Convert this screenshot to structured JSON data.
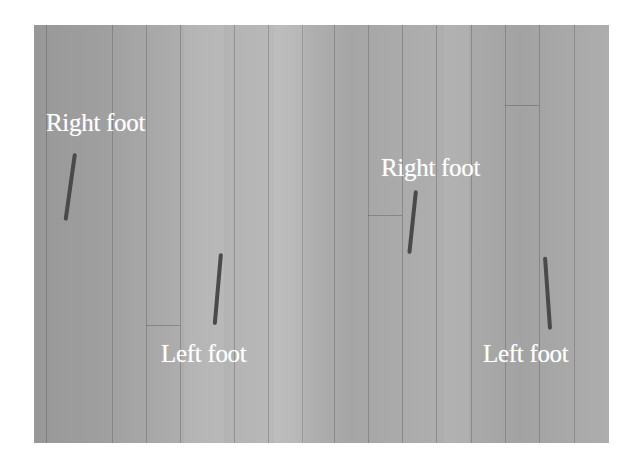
{
  "figure": {
    "labels": [
      {
        "id": "right-foot-1",
        "text": "Right foot",
        "x": 46,
        "y": 110
      },
      {
        "id": "left-foot-1",
        "text": "Left foot",
        "x": 161,
        "y": 341
      },
      {
        "id": "right-foot-2",
        "text": "Right foot",
        "x": 381,
        "y": 155
      },
      {
        "id": "left-foot-2",
        "text": "Left foot",
        "x": 483,
        "y": 341
      }
    ],
    "marks": [
      {
        "id": "right-foot-mark-1",
        "x": 73,
        "y": 153,
        "length": 68,
        "angle_deg": 8
      },
      {
        "id": "left-foot-mark-1",
        "x": 219,
        "y": 253,
        "length": 72,
        "angle_deg": 5
      },
      {
        "id": "right-foot-mark-2",
        "x": 414,
        "y": 190,
        "length": 64,
        "angle_deg": 6
      },
      {
        "id": "left-foot-mark-2",
        "x": 543,
        "y": 257,
        "length": 73,
        "angle_deg": -4
      }
    ],
    "colors": {
      "floor": "#a9a9a9",
      "label": "#ffffff",
      "mark": "#4a4a4a",
      "background": "#ffffff"
    }
  }
}
